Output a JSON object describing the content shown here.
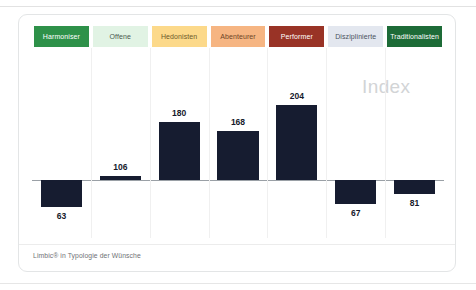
{
  "card": {
    "watermark": "Index",
    "footer_note": "Limbic® in Typologie der Wünsche"
  },
  "chart_data": {
    "type": "bar",
    "title": "Index",
    "xlabel": "",
    "ylabel": "Index",
    "baseline": 100,
    "ylim": [
      0,
      220
    ],
    "grid": false,
    "legend": "none",
    "categories": [
      "Harmoniser",
      "Offene",
      "Hedonisten",
      "Abenteurer",
      "Performer",
      "Disziplinierte",
      "Traditionalisten"
    ],
    "values": [
      63,
      106,
      180,
      168,
      204,
      67,
      81
    ],
    "value_labels": [
      "63",
      "106",
      "180",
      "168",
      "204",
      "67",
      "81"
    ],
    "bar_color": "#161c30",
    "category_colors": [
      "#2e9149",
      "#e1f3e4",
      "#fcd98a",
      "#f6b582",
      "#993326",
      "#e3e7ef",
      "#1d6b37"
    ],
    "category_label_colors": [
      "#ffffff",
      "#4a5a4d",
      "#6d5a2a",
      "#6e4527",
      "#ffffff",
      "#4a5260",
      "#ffffff"
    ],
    "annotations": [
      {
        "text": "Index",
        "role": "watermark"
      },
      {
        "text": "Limbic® in Typologie der Wünsche",
        "role": "source-note"
      }
    ]
  }
}
